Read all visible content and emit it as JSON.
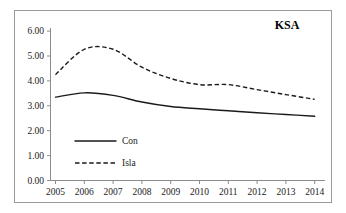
{
  "chart_data": {
    "type": "line",
    "title": "KSA",
    "xlabel": "",
    "ylabel": "",
    "categories": [
      "2005",
      "2006",
      "2007",
      "2008",
      "2009",
      "2010",
      "2011",
      "2012",
      "2013",
      "2014"
    ],
    "x": [
      2005,
      2006,
      2007,
      2008,
      2009,
      2010,
      2011,
      2012,
      2013,
      2014
    ],
    "series": [
      {
        "name": "Con",
        "style": "solid",
        "color": "#1a1a1a",
        "values": [
          3.35,
          3.52,
          3.42,
          3.15,
          2.97,
          2.88,
          2.8,
          2.72,
          2.65,
          2.58
        ]
      },
      {
        "name": "Isla",
        "style": "dashed",
        "color": "#1a1a1a",
        "values": [
          4.25,
          5.27,
          5.27,
          4.55,
          4.1,
          3.85,
          3.85,
          3.65,
          3.45,
          3.26
        ]
      }
    ],
    "ylim": [
      0.0,
      6.0
    ],
    "ytick_step": 1.0,
    "yticks": [
      "0.00",
      "1.00",
      "2.00",
      "3.00",
      "4.00",
      "5.00",
      "6.00"
    ],
    "ytick_values": [
      0.0,
      1.0,
      2.0,
      3.0,
      4.0,
      5.0,
      6.0
    ],
    "grid": false,
    "legend_position": "inside-lower-left",
    "legend_entries": [
      {
        "label": "Con",
        "style": "solid"
      },
      {
        "label": "Isla",
        "style": "dashed"
      }
    ]
  },
  "legend": {
    "con_label": "Con",
    "isla_label": "Isla"
  },
  "title": {
    "text": "KSA"
  }
}
